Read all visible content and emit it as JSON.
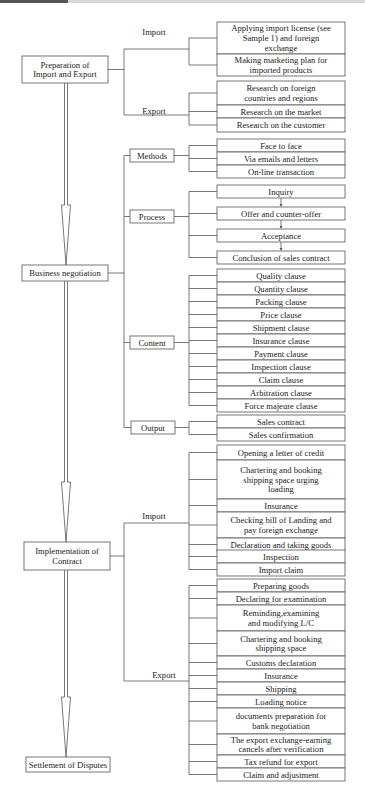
{
  "diagram": {
    "type": "flowchart-tree",
    "stages": [
      {
        "label": [
          "Preparation of",
          "Import and Export"
        ],
        "groups": [
          {
            "label": "Import",
            "items": [
              [
                "Applying import license (see",
                "Sample 1) and foreign",
                "exchange"
              ],
              [
                "Making marketing plan for",
                "imported products"
              ]
            ]
          },
          {
            "label": "Export",
            "items": [
              [
                "Research on foreign",
                "countries and regions"
              ],
              [
                "Research on the market"
              ],
              [
                "Research on the customer"
              ]
            ]
          }
        ]
      },
      {
        "label": [
          "Business negotiation"
        ],
        "groups": [
          {
            "label": "Methods",
            "boxed": true,
            "items": [
              [
                "Face to face"
              ],
              [
                "Via emails and letters"
              ],
              [
                "On-line transaction"
              ]
            ]
          },
          {
            "label": "Process",
            "boxed": true,
            "sequential": true,
            "items": [
              [
                "Inquiry"
              ],
              [
                "Offer and counter-offer"
              ],
              [
                "Acceptance"
              ],
              [
                "Conclusion of sales contract"
              ]
            ]
          },
          {
            "label": "Content",
            "boxed": true,
            "items": [
              [
                "Quality clause"
              ],
              [
                "Quantity clause"
              ],
              [
                "Packing clause"
              ],
              [
                "Price clause"
              ],
              [
                "Shipment clause"
              ],
              [
                "Insurance clause"
              ],
              [
                "Payment clause"
              ],
              [
                "Inspection clause"
              ],
              [
                "Claim clause"
              ],
              [
                "Arbitration clause"
              ],
              [
                "Force majeure clause"
              ]
            ]
          },
          {
            "label": "Output",
            "boxed": true,
            "items": [
              [
                "Sales contract"
              ],
              [
                "Sales confirmation"
              ]
            ]
          }
        ]
      },
      {
        "label": [
          "Implementation of",
          "Contract"
        ],
        "groups": [
          {
            "label": "Import",
            "items": [
              [
                "Opening a letter of credit"
              ],
              [
                "Chartering and booking",
                "shipping space urging",
                "loading"
              ],
              [
                "Insurance"
              ],
              [
                "Checking bill of Landing and",
                "pay foreign exchange"
              ],
              [
                "Declaration and taking goods"
              ],
              [
                "Inspection"
              ],
              [
                "Import claim"
              ]
            ]
          },
          {
            "label": "Export",
            "items": [
              [
                "Preparing goods"
              ],
              [
                "Declaring for examination"
              ],
              [
                "Reminding,examining",
                "and modifying L/C"
              ],
              [
                "Chartering and booking",
                "shipping space"
              ],
              [
                "Customs declaration"
              ],
              [
                "Insurance"
              ],
              [
                "Shipping"
              ],
              [
                "Loading notice"
              ],
              [
                "documents preparation for",
                "bank negotiation"
              ],
              [
                "The export exchange-earning",
                "cancels after verification"
              ],
              [
                "Tax refund for export"
              ],
              [
                "Claim and adjustment"
              ]
            ]
          }
        ]
      },
      {
        "label": [
          "Settlement of Disputes"
        ],
        "groups": []
      }
    ]
  }
}
